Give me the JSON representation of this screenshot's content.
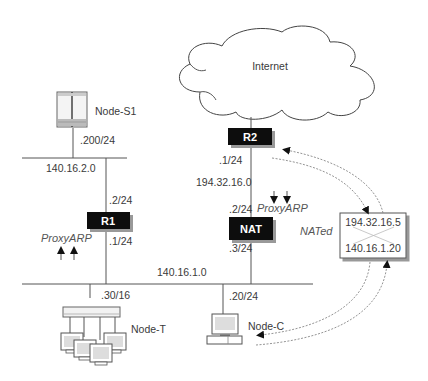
{
  "cloud": {
    "label": "Internet"
  },
  "routers": {
    "r1": {
      "label": "R1",
      "upper_if": ".2/24",
      "lower_if": ".1/24"
    },
    "r2": {
      "label": "R2",
      "lower_if": ".1/24"
    },
    "nat": {
      "label": "NAT",
      "upper_if": ".2/24",
      "lower_if": ".3/24"
    }
  },
  "networks": {
    "net_s1": "140.16.2.0",
    "net_internet": "194.32.16.0",
    "net_main": "140.16.1.0"
  },
  "nodes": {
    "s1": {
      "label": "Node-S1",
      "if": ".200/24"
    },
    "t": {
      "label": "Node-T",
      "if": ".30/16"
    },
    "c": {
      "label": "Node-C",
      "if": ".20/24"
    }
  },
  "annotations": {
    "proxyarp_r1": "ProxyARP",
    "proxyarp_nat": "ProxyARP",
    "nated": "NATed"
  },
  "nat_table": {
    "external": "194.32.16.5",
    "internal": "140.16.1.20"
  }
}
